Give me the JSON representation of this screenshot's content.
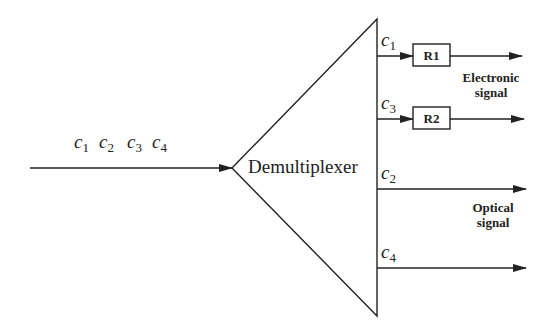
{
  "diagram": {
    "input": {
      "channels": [
        {
          "sym": "c",
          "sub": "1"
        },
        {
          "sym": "c",
          "sub": "2"
        },
        {
          "sym": "c",
          "sub": "3"
        },
        {
          "sym": "c",
          "sub": "4"
        }
      ]
    },
    "demux": {
      "label": "Demultiplexer"
    },
    "outputs": [
      {
        "sym": "c",
        "sub": "1",
        "receiver": "R1"
      },
      {
        "sym": "c",
        "sub": "3",
        "receiver": "R2"
      },
      {
        "sym": "c",
        "sub": "2"
      },
      {
        "sym": "c",
        "sub": "4"
      }
    ],
    "groups": {
      "electronic": {
        "line1": "Electronic",
        "line2": "signal"
      },
      "optical": {
        "line1": "Optical",
        "line2": "signal"
      }
    },
    "colors": {
      "stroke": "#222222",
      "background": "#ffffff"
    }
  }
}
